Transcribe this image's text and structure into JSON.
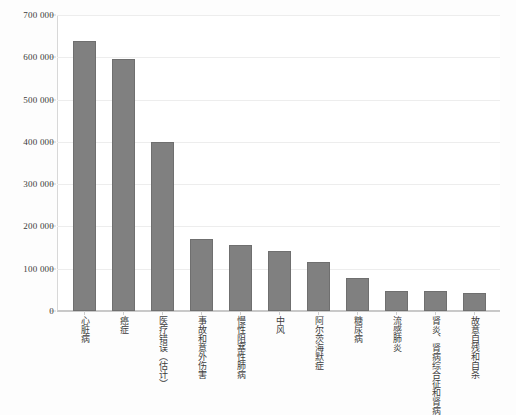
{
  "chart_data": {
    "type": "bar",
    "title": "",
    "subtitle": "",
    "xlabel": "",
    "ylabel": "",
    "ylim": [
      0,
      700000
    ],
    "grid": true,
    "legend": false,
    "legend_position": "none",
    "bar_color": "#808080",
    "bar_edge_color": "#6f6f6f",
    "gridline_color": "#ededed",
    "axis_color": "#c8c8c8",
    "background_color": "#ffffff",
    "page_background_color": "#fdfdfd",
    "ytick_labels": [
      "700 000",
      "600 000",
      "500 000",
      "400 000",
      "300 000",
      "200 000",
      "100 000",
      "0"
    ],
    "ytick_values": [
      700000,
      600000,
      500000,
      400000,
      300000,
      200000,
      100000,
      0
    ],
    "categories": [
      "心脏病",
      "癌症",
      "医疗错误（估计）",
      "事故和意外伤害",
      "慢性阻塞性肺病",
      "中风",
      "阿尔茨海默症",
      "糖尿病",
      "流感肺炎",
      "肾炎、肾病综合征和肾病",
      "故意自残和自杀"
    ],
    "values": [
      638000,
      597000,
      400000,
      170000,
      156000,
      142000,
      116000,
      78000,
      48000,
      48000,
      43000
    ]
  }
}
